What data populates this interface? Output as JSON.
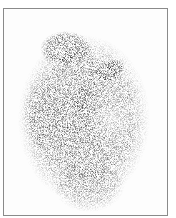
{
  "image": {
    "kind": "scintigraphy-scan",
    "frame_color": "#8a8a8a",
    "background": "#fdfdfd",
    "regions": [
      {
        "name": "upper-left-blob",
        "cx": 62,
        "cy": 42,
        "rx": 24,
        "ry": 16,
        "intensity": 0.75
      },
      {
        "name": "elongated-dark-band-upper",
        "cx": 106,
        "cy": 63,
        "rx": 14,
        "ry": 9,
        "intensity": 0.95
      },
      {
        "name": "elongated-dark-band-lower",
        "cx": 78,
        "cy": 90,
        "rx": 9,
        "ry": 14,
        "intensity": 0.85
      },
      {
        "name": "main-body",
        "cx": 82,
        "cy": 115,
        "rx": 64,
        "ry": 82,
        "intensity": 0.5
      }
    ]
  }
}
